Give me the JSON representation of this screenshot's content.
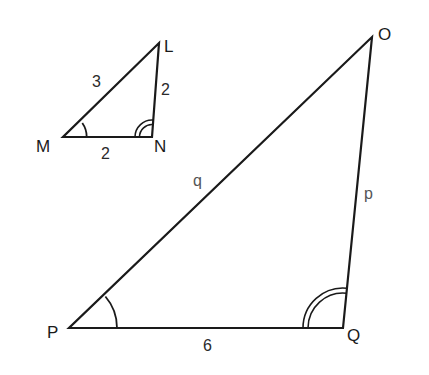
{
  "figure": {
    "small_triangle": {
      "name": "LMN",
      "vertices": {
        "L": "L",
        "M": "M",
        "N": "N"
      },
      "sides": {
        "ML": "3",
        "LN": "2",
        "MN": "2"
      },
      "angle_marks": {
        "M": "single arc",
        "N": "double arc"
      }
    },
    "large_triangle": {
      "name": "OPQ",
      "vertices": {
        "O": "O",
        "P": "P",
        "Q": "Q"
      },
      "sides": {
        "PO": "q",
        "OQ": "p",
        "PQ": "6"
      },
      "angle_marks": {
        "P": "single arc",
        "Q": "double arc"
      }
    }
  },
  "colors": {
    "stroke": "#1a1a1a",
    "background": "#ffffff"
  }
}
